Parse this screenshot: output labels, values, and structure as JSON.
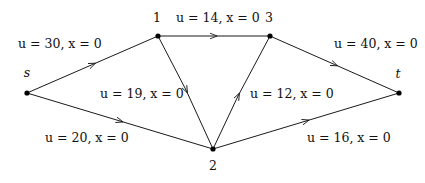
{
  "diagram": {
    "type": "network-flow-graph",
    "nodes": [
      {
        "id": "s",
        "label": "s",
        "x": 27,
        "y": 93
      },
      {
        "id": "1",
        "label": "1",
        "x": 158,
        "y": 36
      },
      {
        "id": "3",
        "label": "3",
        "x": 270,
        "y": 36
      },
      {
        "id": "t",
        "label": "t",
        "x": 399,
        "y": 93
      },
      {
        "id": "2",
        "label": "2",
        "x": 213,
        "y": 149
      }
    ],
    "edges": [
      {
        "from": "s",
        "to": "1",
        "label": "u = 30, x = 0"
      },
      {
        "from": "s",
        "to": "2",
        "label": "u = 20, x = 0"
      },
      {
        "from": "1",
        "to": "3",
        "label": "u = 14, x = 0"
      },
      {
        "from": "1",
        "to": "2",
        "label": "u = 19, x = 0"
      },
      {
        "from": "2",
        "to": "3",
        "label": "u = 12, x = 0"
      },
      {
        "from": "3",
        "to": "t",
        "label": "u = 40, x = 0"
      },
      {
        "from": "2",
        "to": "t",
        "label": "u = 16, x = 0"
      }
    ]
  }
}
